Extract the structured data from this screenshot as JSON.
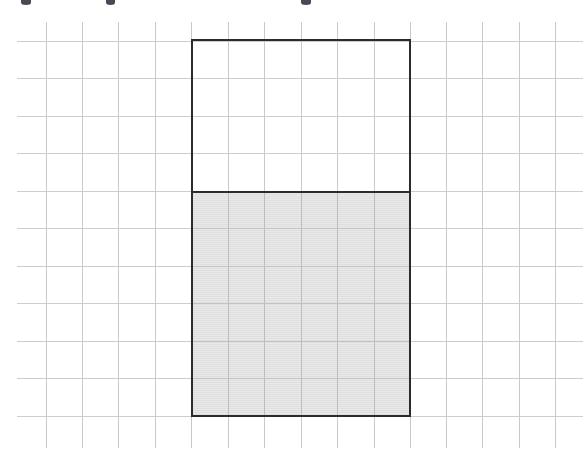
{
  "figure": {
    "title": "",
    "canvas_width": 587,
    "canvas_height": 451,
    "background_color": "#ffffff"
  },
  "grid": {
    "label": "graph-paper-grid",
    "line_color": "#c9c9c9",
    "line_width": 1,
    "cell_width": 36.4,
    "cell_height": 37.5,
    "vertical_line_x": [
      46,
      82,
      118,
      155,
      191,
      228,
      264,
      301,
      337,
      374,
      410,
      446,
      482,
      519,
      555
    ],
    "horizontal_line_y": [
      41,
      78,
      116,
      153,
      191,
      228,
      266,
      303,
      341,
      378,
      416
    ],
    "vertical_span_y": [
      22,
      448
    ],
    "horizontal_span_x": [
      17,
      583
    ],
    "columns_count": 15,
    "rows_count": 11
  },
  "rectangle": {
    "label": "outlined-rectangle",
    "stroke_color": "#2b2b2b",
    "stroke_width": 2,
    "fill_color": "none",
    "left": 191,
    "top": 39,
    "right": 411,
    "bottom": 417,
    "width": 220,
    "height": 378,
    "width_in_cells": 6,
    "height_in_cells": 10
  },
  "shaded_fill": {
    "label": "shaded-lower-portion",
    "color": "#dedede",
    "texture": "horizontal-scanlines",
    "top": 191,
    "bottom": 417,
    "left": 193,
    "right": 409,
    "height": 226,
    "height_in_cells": 6,
    "fraction_of_rectangle": "6/10"
  },
  "fill_level_line": {
    "label": "fill-boundary-line",
    "color": "#2b2b2b",
    "thickness": 2,
    "y": 191
  },
  "top_text_remnants": [
    {
      "label": "descender-fragment",
      "x": 21,
      "width": 10
    },
    {
      "label": "descender-fragment",
      "x": 106,
      "width": 9
    },
    {
      "label": "descender-fragment",
      "x": 301,
      "width": 10
    }
  ],
  "chart_data": {
    "type": "area",
    "title": "",
    "subtitle": "",
    "xlabel": "",
    "ylabel": "",
    "categories": [
      "rectangle"
    ],
    "values": [
      6
    ],
    "series": [
      {
        "name": "shaded (filled) rows",
        "values": [
          6
        ]
      },
      {
        "name": "unshaded (empty) rows",
        "values": [
          4
        ]
      }
    ],
    "total_rows": 10,
    "total_columns": 6,
    "fraction_shaded": 0.6,
    "grid": true,
    "legend": "none",
    "xlim": [
      0,
      6
    ],
    "ylim": [
      0,
      10
    ],
    "annotations": []
  }
}
